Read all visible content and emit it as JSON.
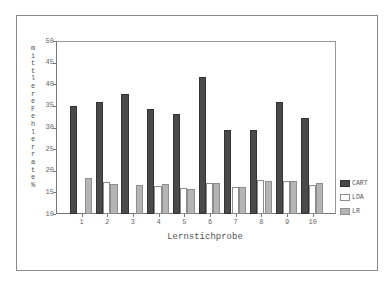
{
  "chart_data": {
    "type": "bar",
    "title": "",
    "xlabel": "Lernstichprobe",
    "ylabel": "mittlere Fehlerrate %",
    "ylim": [
      10,
      50
    ],
    "yticks": [
      "50",
      "45",
      "40",
      "35",
      "30",
      "25",
      "20",
      "15",
      "10"
    ],
    "grid": false,
    "legend_position": "right",
    "categories": [
      "1",
      "2",
      "3",
      "4",
      "5",
      "6",
      "7",
      "8",
      "9",
      "10"
    ],
    "series": [
      {
        "name": "CART",
        "color": "#4a4a4a",
        "values": [
          35.0,
          35.8,
          37.8,
          34.2,
          33.2,
          41.6,
          29.5,
          29.5,
          35.8,
          32.1
        ]
      },
      {
        "name": "LDA",
        "color": "#ffffff",
        "values": [
          null,
          17.3,
          null,
          16.5,
          15.9,
          17.1,
          16.3,
          17.9,
          17.6,
          16.7
        ]
      },
      {
        "name": "LR",
        "color": "#b5b5b5",
        "values": [
          18.3,
          16.9,
          16.7,
          16.9,
          15.8,
          17.1,
          16.3,
          17.6,
          17.6,
          17.2
        ]
      }
    ]
  },
  "axis": {
    "xlabel": "Lernstichprobe",
    "ylabel": "mittlere Fehlerrate %"
  },
  "legend": {
    "items": [
      {
        "label": "CART"
      },
      {
        "label": "LDA"
      },
      {
        "label": "LR"
      }
    ]
  }
}
